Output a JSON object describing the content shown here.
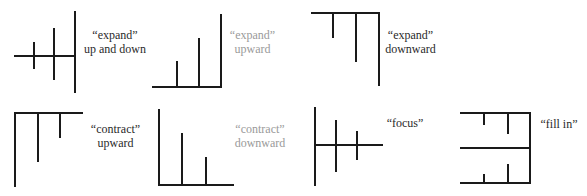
{
  "diagrams": [
    {
      "id": "expand-up-down",
      "label_line1": "“expand”",
      "label_line2": "up and down"
    },
    {
      "id": "expand-upward",
      "label_line1": "“expand”",
      "label_line2": "upward"
    },
    {
      "id": "expand-downward",
      "label_line1": "“expand”",
      "label_line2": "downward"
    },
    {
      "id": "contract-upward",
      "label_line1": "“contract”",
      "label_line2": "upward"
    },
    {
      "id": "contract-downward",
      "label_line1": "“contract”",
      "label_line2": "downward"
    },
    {
      "id": "focus",
      "label_line1": "“focus”",
      "label_line2": ""
    },
    {
      "id": "fill-in",
      "label_line1": "“fill in”",
      "label_line2": ""
    }
  ],
  "colors": {
    "line": "#1a1a1a",
    "text": "#2a2a2a"
  }
}
